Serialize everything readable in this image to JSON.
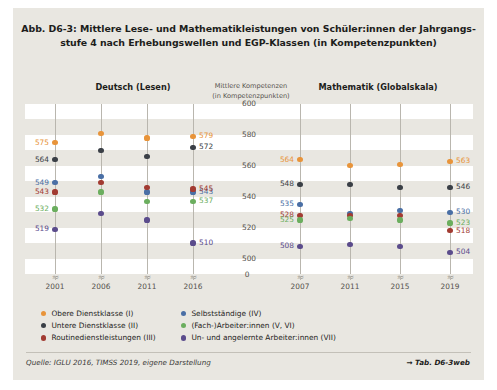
{
  "figure": {
    "title_line_1": "Abb. D6-3: Mittlere Lese- und Mathematikleistungen von Schüler:innen der Jahrgangs-",
    "title_line_2": "stufe 4 nach Erhebungswellen und EGP-Klassen (in Kompetenzpunkten)",
    "source": "Quelle: IGLU 2016, TIMSS 2019, eigene Darstellung",
    "table_reference": "→ Tab. D6-3web"
  },
  "panels": {
    "left_header": "Deutsch (Lesen)",
    "right_header": "Mathematik (Globalskala)",
    "axis_header_line_1": "Mittlere Kompetenzen",
    "axis_header_line_2": "(in Kompetenzpunkten)"
  },
  "colors": {
    "obere_dienstklasse": "#E8943A",
    "untere_dienstklasse": "#3A3F46",
    "routinedienstleistungen": "#A23B32",
    "selbststaendige": "#4A6FA5",
    "fach_arbeiter": "#6BAE5E",
    "un_angelernte": "#5B4C8C",
    "band": "#FFFFFF",
    "panel_background": "#E9E7E1",
    "rule": "#B9B6AE"
  },
  "legend": {
    "column_a": [
      {
        "label": "Obere Dienstklasse (I)",
        "color_key": "obere_dienstklasse"
      },
      {
        "label": "Untere Dienstklasse (II)",
        "color_key": "untere_dienstklasse"
      },
      {
        "label": "Routinedienstleistungen (III)",
        "color_key": "routinedienstleistungen"
      }
    ],
    "column_b": [
      {
        "label": "Selbstständige (IV)",
        "color_key": "selbststaendige"
      },
      {
        "label": "(Fach-)Arbeiter:innen (V, VI)",
        "color_key": "fach_arbeiter"
      },
      {
        "label": "Un- und angelernte Arbeiter:innen (VII)",
        "color_key": "un_angelernte"
      }
    ]
  },
  "chart_data": {
    "type": "scatter",
    "xlabel": "",
    "ylabel": "Mittlere Kompetenzen (in Kompetenzpunkten)",
    "ylim": [
      490,
      600
    ],
    "yticks": [
      600,
      580,
      560,
      540,
      520,
      500
    ],
    "axis_break_label": "0",
    "grid": "horizontal-bands",
    "legend_position": "bottom",
    "panels": [
      {
        "name": "Deutsch (Lesen)",
        "categories": [
          "2001",
          "2006",
          "2011",
          "2016"
        ],
        "series": [
          {
            "name": "Obere Dienstklasse (I)",
            "color_key": "obere_dienstklasse",
            "values": [
              575,
              581,
              578,
              579
            ],
            "labels": {
              "2001": 575,
              "2016": 579
            }
          },
          {
            "name": "Untere Dienstklasse (II)",
            "color_key": "untere_dienstklasse",
            "values": [
              564,
              570,
              566,
              572
            ],
            "labels": {
              "2001": 564,
              "2016": 572
            }
          },
          {
            "name": "Selbstständige (IV)",
            "color_key": "selbststaendige",
            "values": [
              549,
              553,
              543,
              543
            ],
            "labels": {
              "2001": 549,
              "2016": 543
            }
          },
          {
            "name": "Routinedienstleistungen (III)",
            "color_key": "routinedienstleistungen",
            "values": [
              543,
              549,
              546,
              545
            ],
            "labels": {
              "2001": 543,
              "2016": 545
            }
          },
          {
            "name": "(Fach-)Arbeiter:innen (V, VI)",
            "color_key": "fach_arbeiter",
            "values": [
              532,
              543,
              537,
              537
            ],
            "labels": {
              "2001": 532,
              "2016": 537
            }
          },
          {
            "name": "Un- und angelernte Arbeiter:innen (VII)",
            "color_key": "un_angelernte",
            "values": [
              519,
              529,
              525,
              510
            ],
            "labels": {
              "2001": 519,
              "2016": 510
            }
          }
        ]
      },
      {
        "name": "Mathematik (Globalskala)",
        "categories": [
          "2007",
          "2011",
          "2015",
          "2019"
        ],
        "series": [
          {
            "name": "Obere Dienstklasse (I)",
            "color_key": "obere_dienstklasse",
            "values": [
              564,
              560,
              561,
              563
            ],
            "labels": {
              "2007": 564,
              "2019": 563
            }
          },
          {
            "name": "Untere Dienstklasse (II)",
            "color_key": "untere_dienstklasse",
            "values": [
              548,
              548,
              546,
              546
            ],
            "labels": {
              "2007": 548,
              "2019": 546
            }
          },
          {
            "name": "Selbstständige (IV)",
            "color_key": "selbststaendige",
            "values": [
              535,
              529,
              531,
              530
            ],
            "labels": {
              "2007": 535,
              "2019": 530
            }
          },
          {
            "name": "Routinedienstleistungen (III)",
            "color_key": "routinedienstleistungen",
            "values": [
              528,
              528,
              528,
              518
            ],
            "labels": {
              "2007": 528,
              "2019": 518
            }
          },
          {
            "name": "(Fach-)Arbeiter:innen (V, VI)",
            "color_key": "fach_arbeiter",
            "values": [
              525,
              526,
              525,
              523
            ],
            "labels": {
              "2007": 525,
              "2019": 523
            }
          },
          {
            "name": "Un- und angelernte Arbeiter:innen (VII)",
            "color_key": "un_angelernte",
            "values": [
              508,
              509,
              508,
              504
            ],
            "labels": {
              "2007": 508,
              "2019": 504
            }
          }
        ]
      }
    ]
  }
}
